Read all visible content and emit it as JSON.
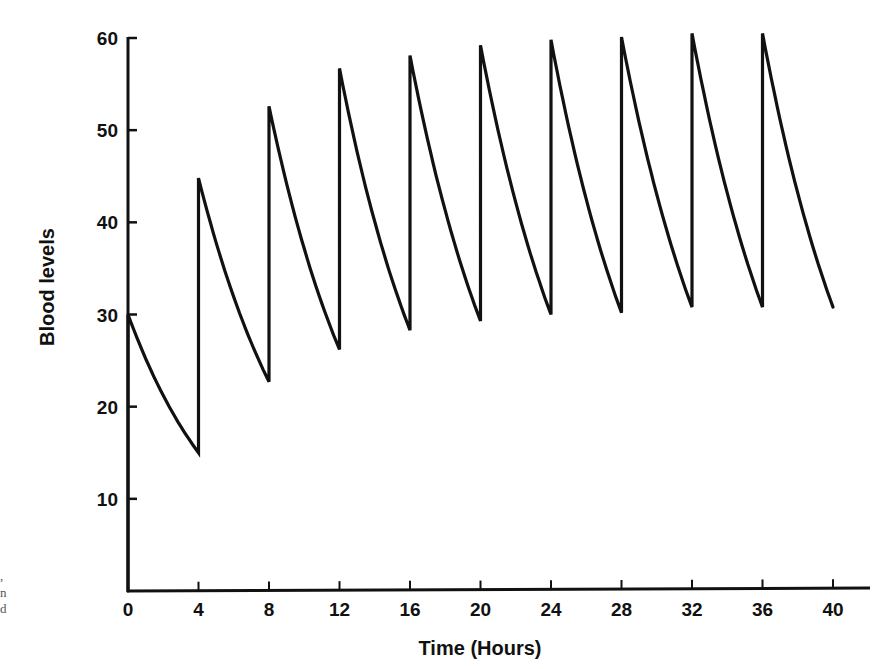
{
  "chart_data": {
    "type": "line",
    "title": "",
    "xlabel": "Time (Hours)",
    "ylabel": "Blood levels",
    "xlim": [
      0,
      40
    ],
    "ylim": [
      0,
      60
    ],
    "x_ticks": [
      0,
      4,
      8,
      12,
      16,
      20,
      24,
      28,
      32,
      36,
      40
    ],
    "y_ticks": [
      10,
      20,
      30,
      40,
      50,
      60
    ],
    "grid": false,
    "legend": null,
    "dosing_interval_hours": 4,
    "series": [
      {
        "name": "Blood level (repeated dosing every 4 h)",
        "points": [
          {
            "x": 0,
            "y": 0
          },
          {
            "x": 0,
            "y": 30
          },
          {
            "x": 4,
            "y": 15
          },
          {
            "x": 4,
            "y": 44.8
          },
          {
            "x": 8,
            "y": 22.7
          },
          {
            "x": 8,
            "y": 52.6
          },
          {
            "x": 12,
            "y": 26.2
          },
          {
            "x": 12,
            "y": 56.7
          },
          {
            "x": 16,
            "y": 28.3
          },
          {
            "x": 16,
            "y": 58.1
          },
          {
            "x": 20,
            "y": 29.3
          },
          {
            "x": 20,
            "y": 59.2
          },
          {
            "x": 24,
            "y": 30
          },
          {
            "x": 24,
            "y": 59.8
          },
          {
            "x": 28,
            "y": 30.2
          },
          {
            "x": 28,
            "y": 60.1
          },
          {
            "x": 32,
            "y": 30.8
          },
          {
            "x": 32,
            "y": 60.5
          },
          {
            "x": 36,
            "y": 30.8
          },
          {
            "x": 36,
            "y": 60.5
          },
          {
            "x": 40,
            "y": 30.8
          }
        ],
        "peaks": [
          30,
          44.8,
          52.6,
          56.7,
          58.1,
          59.2,
          59.8,
          60.1,
          60.5,
          60.5
        ],
        "troughs": [
          15,
          22.7,
          26.2,
          28.3,
          29.3,
          30,
          30.2,
          30.8,
          30.8,
          30.8
        ]
      }
    ]
  },
  "page": {
    "margin_fragments": [
      ",",
      "n",
      "d"
    ]
  }
}
